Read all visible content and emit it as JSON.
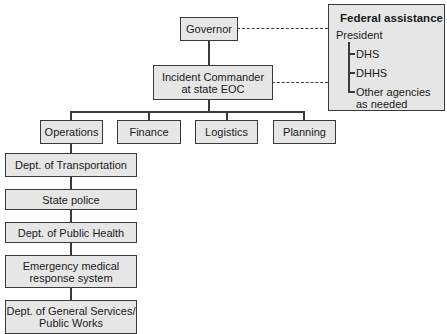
{
  "diagram": {
    "type": "organizational-chart",
    "governor": "Governor",
    "incident_commander": [
      "Incident Commander",
      "at state EOC"
    ],
    "sections": [
      "Operations",
      "Finance",
      "Logistics",
      "Planning"
    ],
    "operations_units": [
      {
        "lines": [
          "Dept. of Transportation"
        ]
      },
      {
        "lines": [
          "State police"
        ]
      },
      {
        "lines": [
          "Dept. of Public Health"
        ]
      },
      {
        "lines": [
          "Emergency medical",
          "response system"
        ]
      },
      {
        "lines": [
          "Dept. of General Services/",
          "Public Works"
        ]
      }
    ],
    "federal": {
      "title": "Federal assistance",
      "head": "President",
      "items": [
        {
          "lines": [
            "DHS"
          ]
        },
        {
          "lines": [
            "DHHS"
          ]
        },
        {
          "lines": [
            "Other agencies",
            "as needed"
          ]
        }
      ]
    }
  },
  "colors": {
    "box_fill": "#e6e6e6",
    "line": "#3a3a3a"
  }
}
